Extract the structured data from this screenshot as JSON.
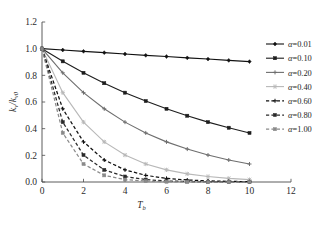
{
  "chart_data": {
    "type": "line",
    "title": "",
    "xlabel": "T_b",
    "xlabel_main": "T",
    "xlabel_sub": "b",
    "ylabel": "k_v/k_v0",
    "ylabel_main1": "k",
    "ylabel_sub1": "v",
    "ylabel_sep": "/",
    "ylabel_main2": "k",
    "ylabel_sub2": "v0",
    "xlim": [
      0,
      12
    ],
    "ylim": [
      0,
      1.2
    ],
    "xticks": [
      0,
      2,
      4,
      6,
      8,
      10,
      12
    ],
    "xtick_labels": [
      "0",
      "2",
      "4",
      "6",
      "8",
      "10",
      "12"
    ],
    "yticks": [
      0.0,
      0.2,
      0.4,
      0.6,
      0.8,
      1.0,
      1.2
    ],
    "ytick_labels": [
      "0.0",
      "0.2",
      "0.4",
      "0.6",
      "0.8",
      "1.0",
      "1.2"
    ],
    "grid": false,
    "legend_position": "right-outside",
    "x": [
      0,
      1,
      2,
      3,
      4,
      5,
      6,
      7,
      8,
      9,
      10
    ],
    "series": [
      {
        "name": "α=0.01",
        "alpha": 0.01,
        "color": "#111111",
        "linestyle": "solid",
        "marker": "diamond",
        "values": [
          1.0,
          0.99,
          0.98,
          0.97,
          0.96,
          0.95,
          0.941,
          0.931,
          0.922,
          0.912,
          0.903
        ]
      },
      {
        "name": "α=0.10",
        "alpha": 0.1,
        "color": "#1d1d1d",
        "linestyle": "solid",
        "marker": "square",
        "values": [
          1.0,
          0.905,
          0.819,
          0.741,
          0.67,
          0.607,
          0.549,
          0.497,
          0.449,
          0.407,
          0.368
        ]
      },
      {
        "name": "α=0.20",
        "alpha": 0.2,
        "color": "#6e6e6e",
        "linestyle": "solid",
        "marker": "plus",
        "values": [
          1.0,
          0.819,
          0.67,
          0.549,
          0.449,
          0.368,
          0.301,
          0.247,
          0.202,
          0.165,
          0.135
        ]
      },
      {
        "name": "α=0.40",
        "alpha": 0.4,
        "color": "#b8b8b8",
        "linestyle": "solid",
        "marker": "cross",
        "values": [
          1.0,
          0.67,
          0.449,
          0.301,
          0.202,
          0.135,
          0.091,
          0.061,
          0.041,
          0.027,
          0.018
        ]
      },
      {
        "name": "α=0.60",
        "alpha": 0.6,
        "color": "#0f0f0f",
        "linestyle": "dashed",
        "marker": "plus",
        "values": [
          1.0,
          0.549,
          0.301,
          0.165,
          0.091,
          0.05,
          0.027,
          0.015,
          0.008,
          0.005,
          0.002
        ]
      },
      {
        "name": "α=0.80",
        "alpha": 0.8,
        "color": "#2a2a2a",
        "linestyle": "dashed",
        "marker": "square",
        "values": [
          1.0,
          0.449,
          0.202,
          0.091,
          0.041,
          0.018,
          0.008,
          0.004,
          0.002,
          0.001,
          0.0
        ]
      },
      {
        "name": "α=1.00",
        "alpha": 1.0,
        "color": "#8a8a8a",
        "linestyle": "dashed",
        "marker": "square",
        "values": [
          1.0,
          0.368,
          0.135,
          0.05,
          0.018,
          0.007,
          0.002,
          0.001,
          0.0,
          0.0,
          0.0
        ]
      }
    ]
  },
  "legend": {
    "entries": [
      {
        "label": "α=0.01"
      },
      {
        "label": "α=0.10"
      },
      {
        "label": "α=0.20"
      },
      {
        "label": "α=0.40"
      },
      {
        "label": "α=0.60"
      },
      {
        "label": "α=0.80"
      },
      {
        "label": "α=1.00"
      }
    ]
  }
}
